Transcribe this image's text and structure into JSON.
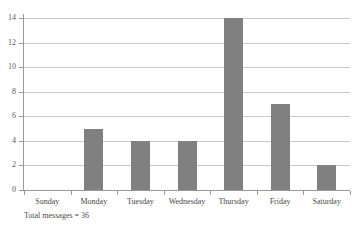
{
  "chart_data": {
    "type": "bar",
    "title": "",
    "subtitle": "",
    "xlabel": "",
    "ylabel": "",
    "categories": [
      "Sunday",
      "Monday",
      "Tuesday",
      "Wednesday",
      "Thursday",
      "Friday",
      "Saturday"
    ],
    "values": [
      0,
      5,
      4,
      4,
      14,
      7,
      2
    ],
    "series": [
      {
        "name": "Messages",
        "values": [
          0,
          5,
          4,
          4,
          14,
          7,
          2
        ]
      }
    ],
    "ylim": [
      0,
      14
    ],
    "ytick_labels": [
      "0",
      "2",
      "4",
      "6",
      "8",
      "10",
      "12",
      "14"
    ],
    "ytick_values": [
      0,
      2,
      4,
      6,
      8,
      10,
      12,
      14
    ],
    "grid": true,
    "legend": false,
    "legend_position": "none",
    "annotations": [
      "Total messages = 36"
    ],
    "bar_color": "#808080",
    "gridline_color": "#c9c9c9",
    "axis_color": "#9a9a9a",
    "background_color": "#ffffff"
  },
  "footer": {
    "total_messages_note": "Total messages = 36"
  }
}
